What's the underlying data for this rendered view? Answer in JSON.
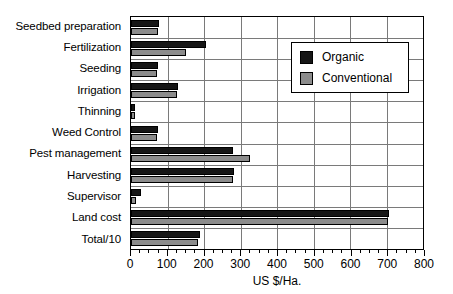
{
  "chart_data": {
    "type": "bar",
    "orientation": "horizontal",
    "title": "",
    "xlabel": "US $/Ha.",
    "ylabel": "",
    "xlim": [
      0,
      800
    ],
    "xticks": [
      0,
      100,
      200,
      300,
      400,
      500,
      600,
      700,
      800
    ],
    "xtick_labels": [
      "0",
      "100",
      "200",
      "300",
      "400",
      "500",
      "600",
      "700",
      "800"
    ],
    "minor_tick_step": 25,
    "grid": "vertical-and-horizontal",
    "legend_position": "upper-right",
    "categories": [
      "Seedbed preparation",
      "Fertilization",
      "Seeding",
      "Irrigation",
      "Thinning",
      "Weed Control",
      "Pest management",
      "Harvesting",
      "Supervisor",
      "Land cost",
      "Total/10"
    ],
    "series": [
      {
        "name": "Organic",
        "color": "#161616",
        "values": [
          78,
          205,
          75,
          128,
          12,
          73,
          280,
          282,
          28,
          707,
          190
        ]
      },
      {
        "name": "Conventional",
        "color": "#8c8c8c",
        "values": [
          75,
          150,
          70,
          125,
          10,
          70,
          325,
          280,
          15,
          705,
          183
        ]
      }
    ]
  },
  "legend": {
    "items": [
      {
        "label": "Organic",
        "swatch": "organic"
      },
      {
        "label": "Conventional",
        "swatch": "conventional"
      }
    ]
  },
  "colors": {
    "organic": "#161616",
    "conventional": "#8c8c8c",
    "grid": "#7a7a7a",
    "axis": "#000000",
    "background": "#ffffff"
  }
}
